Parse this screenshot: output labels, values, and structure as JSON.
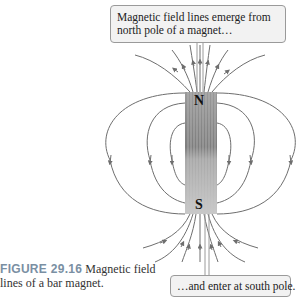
{
  "figure": {
    "label": "FIGURE 29.16",
    "caption": "Magnetic field lines of a bar magnet."
  },
  "callouts": {
    "top": "Magnetic field lines emerge from north pole of a magnet…",
    "bottom": "…and enter at south pole."
  },
  "magnet": {
    "north_label": "N",
    "south_label": "S",
    "color": "#8a8a8a"
  },
  "colors": {
    "field_line": "#6e6e6e",
    "callout_bg": "#f2f2f2",
    "caption_label": "#7a8fa3"
  }
}
